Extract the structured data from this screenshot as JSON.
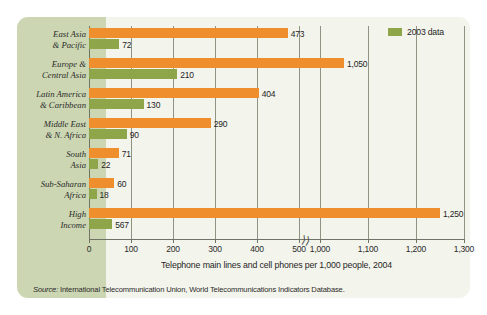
{
  "legend": {
    "label": "2003 data",
    "swatch_color": "#8fa549",
    "position": "top-right"
  },
  "colors": {
    "current_series": "#ef8e2c",
    "previous_series": "#8fa549",
    "card_background": "#f3f4ec",
    "label_band_background": "#ccd6b2",
    "gridline": "#8e9384",
    "text": "#1f1f1f"
  },
  "axis": {
    "title": "Telephone main lines and cell phones per 1,000 people, 2004",
    "tick_labels": [
      "0",
      "100",
      "200",
      "300",
      "400",
      "500",
      "1,000",
      "1,100",
      "1,200",
      "1,300"
    ],
    "break_symbol": "⟩⟩",
    "break_between": [
      "500",
      "1,000"
    ]
  },
  "source": {
    "prefix": "Source:",
    "text": " International Telecommunication Union, World Telecommunications Indicators Database."
  },
  "chart_data": {
    "type": "bar",
    "orientation": "horizontal",
    "title": "",
    "subtitle": "",
    "xlabel": "Telephone main lines and cell phones per 1,000 people, 2004",
    "ylabel": "",
    "xlim": [
      0,
      1300
    ],
    "axis_break": [
      500,
      1000
    ],
    "grid": true,
    "legend_position": "top-right",
    "categories": [
      "East Asia & Pacific",
      "Europe & Central Asia",
      "Latin America & Caribbean",
      "Middle East & N. Africa",
      "South Asia",
      "Sub-Saharan Africa",
      "High Income"
    ],
    "category_lines": [
      [
        "East Asia",
        "& Pacific"
      ],
      [
        "Europe &",
        "Central Asia"
      ],
      [
        "Latin America",
        "& Caribbean"
      ],
      [
        "Middle East",
        "& N. Africa"
      ],
      [
        "South",
        "Asia"
      ],
      [
        "Sub-Saharan",
        "Africa"
      ],
      [
        "High",
        "Income"
      ]
    ],
    "series": [
      {
        "name": "2004 data",
        "color": "#ef8e2c",
        "values": [
          473,
          1050,
          404,
          290,
          71,
          60,
          1250
        ],
        "labels": [
          "473",
          "1,050",
          "404",
          "290",
          "71",
          "60",
          "1,250"
        ]
      },
      {
        "name": "2003 data",
        "color": "#8fa549",
        "values": [
          72,
          210,
          130,
          90,
          22,
          18,
          567
        ],
        "labels": [
          "72",
          "210",
          "130",
          "90",
          "22",
          "18",
          "567"
        ]
      }
    ]
  }
}
